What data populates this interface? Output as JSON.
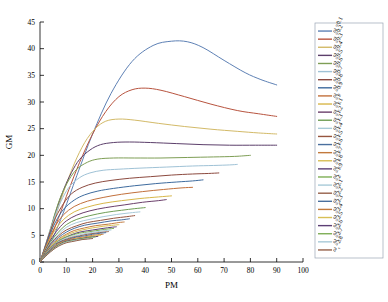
{
  "chart_data": {
    "type": "line",
    "title": "",
    "xlabel": "PM",
    "ylabel": "GM",
    "xlim": [
      0,
      100
    ],
    "ylim": [
      0,
      45
    ],
    "xticks": [
      0,
      10,
      20,
      30,
      40,
      50,
      60,
      70,
      80,
      90,
      100
    ],
    "yticks": [
      0,
      5,
      10,
      15,
      20,
      25,
      30,
      35,
      40,
      45
    ],
    "grid": false,
    "legend_position": "right-outside",
    "legend_symbol": "ω",
    "legend_subscript": "c",
    "series": [
      {
        "name": "ω_c = 0.1",
        "value": 0.1,
        "color": "#5e81b5",
        "x": [
          0,
          2,
          5,
          9,
          14,
          20,
          27,
          35,
          43,
          50,
          56,
          62,
          70,
          78,
          84,
          90
        ],
        "y": [
          0,
          1.6,
          4.6,
          9.4,
          16.2,
          24.0,
          31.6,
          37.6,
          40.6,
          41.4,
          41.3,
          40.2,
          37.8,
          35.5,
          34.2,
          33.2
        ]
      },
      {
        "name": "ω_c = 0.2",
        "value": 0.2,
        "color": "#b8543f",
        "x": [
          0,
          2,
          4,
          7,
          11,
          15,
          20,
          25,
          30,
          35,
          40,
          46,
          55,
          65,
          75,
          83,
          90
        ],
        "y": [
          0,
          2.0,
          4.4,
          8.2,
          13.6,
          18.6,
          24.0,
          28.2,
          31.0,
          32.3,
          32.6,
          32.2,
          31.0,
          29.6,
          28.4,
          27.8,
          27.3
        ]
      },
      {
        "name": "ω_c = 0.3",
        "value": 0.3,
        "color": "#d3ba68",
        "x": [
          0,
          2,
          4,
          6,
          9,
          13,
          17,
          21,
          25,
          30,
          36,
          45,
          55,
          65,
          75,
          83,
          90
        ],
        "y": [
          0,
          2.4,
          5.2,
          8.6,
          13.2,
          18.4,
          22.4,
          25.0,
          26.4,
          26.8,
          26.6,
          26.0,
          25.4,
          24.9,
          24.5,
          24.2,
          24.0
        ]
      },
      {
        "name": "ω_c = 0.4",
        "value": 0.4,
        "color": "#5c3f6b",
        "x": [
          0,
          2,
          4,
          6,
          9,
          12,
          15,
          19,
          23,
          28,
          34,
          42,
          52,
          62,
          72,
          82,
          90
        ],
        "y": [
          0,
          2.8,
          6.0,
          9.4,
          13.6,
          16.8,
          19.2,
          21.0,
          22.0,
          22.4,
          22.5,
          22.4,
          22.2,
          22.0,
          21.9,
          21.9,
          21.9
        ]
      },
      {
        "name": "ω_c = 0.5",
        "value": 0.5,
        "color": "#7e9e55",
        "x": [
          0,
          2,
          4,
          6,
          8,
          11,
          14,
          18,
          22,
          28,
          36,
          46,
          56,
          66,
          74,
          80
        ],
        "y": [
          0,
          3.0,
          6.3,
          9.6,
          12.4,
          15.4,
          17.4,
          18.7,
          19.3,
          19.5,
          19.5,
          19.5,
          19.6,
          19.7,
          19.8,
          20.0
        ]
      },
      {
        "name": "ω_c = 0.6",
        "value": 0.6,
        "color": "#9fc2d6",
        "x": [
          0,
          2,
          4,
          6,
          8,
          11,
          15,
          19,
          24,
          30,
          38,
          48,
          58,
          66,
          72,
          75
        ],
        "y": [
          0,
          3.1,
          6.2,
          9.0,
          11.4,
          14.0,
          15.8,
          16.7,
          17.2,
          17.4,
          17.6,
          17.8,
          18.0,
          18.1,
          18.2,
          18.3
        ]
      },
      {
        "name": "ω_c = 0.7",
        "value": 0.7,
        "color": "#8c4a3f",
        "x": [
          0,
          2,
          4,
          6,
          9,
          12,
          16,
          21,
          27,
          34,
          42,
          50,
          58,
          64,
          68
        ],
        "y": [
          0,
          3.0,
          5.9,
          8.4,
          11.0,
          12.8,
          14.0,
          14.8,
          15.3,
          15.7,
          16.0,
          16.3,
          16.5,
          16.6,
          16.7
        ]
      },
      {
        "name": "ω_c = 0.8",
        "value": 0.8,
        "color": "#3e6b9e",
        "x": [
          0,
          2,
          4,
          6,
          9,
          13,
          17,
          22,
          28,
          36,
          44,
          52,
          58,
          62
        ],
        "y": [
          0,
          2.8,
          5.4,
          7.6,
          9.9,
          11.6,
          12.6,
          13.3,
          13.8,
          14.3,
          14.7,
          15.0,
          15.2,
          15.4
        ]
      },
      {
        "name": "ω_c = 0.9",
        "value": 0.9,
        "color": "#c2703c",
        "x": [
          0,
          2,
          4,
          6,
          9,
          13,
          18,
          24,
          31,
          39,
          47,
          54,
          58
        ],
        "y": [
          0,
          2.6,
          4.9,
          6.9,
          8.9,
          10.4,
          11.4,
          12.1,
          12.7,
          13.2,
          13.6,
          13.9,
          14.0
        ]
      },
      {
        "name": "ω_c = 1",
        "value": 1.0,
        "color": "#d8b74a",
        "x": [
          0,
          2,
          4,
          6,
          9,
          13,
          18,
          24,
          31,
          38,
          45,
          50
        ],
        "y": [
          0,
          2.4,
          4.5,
          6.2,
          8.0,
          9.4,
          10.3,
          11.0,
          11.5,
          11.9,
          12.2,
          12.4
        ]
      },
      {
        "name": "ω_c = 1.1",
        "value": 1.1,
        "color": "#6b3f6b",
        "x": [
          0,
          2,
          4,
          7,
          10,
          14,
          19,
          25,
          32,
          39,
          45,
          48
        ],
        "y": [
          0,
          2.2,
          4.1,
          6.2,
          7.7,
          8.8,
          9.6,
          10.2,
          10.7,
          11.2,
          11.5,
          11.7
        ]
      },
      {
        "name": "ω_c = 1.2",
        "value": 1.2,
        "color": "#6f9e55",
        "x": [
          0,
          2,
          4,
          7,
          10,
          14,
          19,
          25,
          31,
          36,
          40
        ],
        "y": [
          0,
          2.0,
          3.8,
          5.6,
          7.0,
          8.0,
          8.7,
          9.3,
          9.7,
          10.0,
          10.2
        ]
      },
      {
        "name": "ω_c = 1.3",
        "value": 1.3,
        "color": "#a8cad8",
        "x": [
          0,
          2,
          4,
          7,
          10,
          14,
          19,
          24,
          29,
          34,
          38
        ],
        "y": [
          0,
          1.9,
          3.6,
          5.2,
          6.5,
          7.4,
          8.0,
          8.5,
          8.9,
          9.2,
          9.4
        ]
      },
      {
        "name": "ω_c = 1.4",
        "value": 1.4,
        "color": "#96553f",
        "x": [
          0,
          2,
          4,
          7,
          10,
          14,
          18,
          23,
          28,
          33,
          36
        ],
        "y": [
          0,
          1.8,
          3.4,
          4.9,
          6.0,
          6.8,
          7.4,
          7.8,
          8.2,
          8.5,
          8.7
        ]
      },
      {
        "name": "ω_c = 1.5",
        "value": 1.5,
        "color": "#4a6f9e",
        "x": [
          0,
          2,
          4,
          7,
          10,
          13,
          17,
          22,
          27,
          31,
          34
        ],
        "y": [
          0,
          1.7,
          3.2,
          4.6,
          5.6,
          6.3,
          6.9,
          7.3,
          7.7,
          7.9,
          8.1
        ]
      },
      {
        "name": "ω_c = 1.6",
        "value": 1.6,
        "color": "#c2793c",
        "x": [
          0,
          2,
          4,
          7,
          10,
          13,
          17,
          21,
          26,
          30,
          32
        ],
        "y": [
          0,
          1.6,
          3.0,
          4.3,
          5.2,
          5.9,
          6.4,
          6.8,
          7.1,
          7.4,
          7.5
        ]
      },
      {
        "name": "ω_c = 1.7",
        "value": 1.7,
        "color": "#d8bf55",
        "x": [
          0,
          2,
          4,
          7,
          10,
          13,
          16,
          20,
          24,
          28,
          30
        ],
        "y": [
          0,
          1.5,
          2.9,
          4.1,
          5.0,
          5.6,
          6.0,
          6.4,
          6.7,
          6.9,
          7.0
        ]
      },
      {
        "name": "ω_c = 1.8",
        "value": 1.8,
        "color": "#5c3f75",
        "x": [
          0,
          2,
          4,
          7,
          10,
          13,
          16,
          20,
          24,
          27,
          29
        ],
        "y": [
          0,
          1.45,
          2.7,
          3.9,
          4.7,
          5.3,
          5.7,
          6.0,
          6.3,
          6.5,
          6.6
        ]
      },
      {
        "name": "ω_c = 1.9",
        "value": 1.9,
        "color": "#7eae55",
        "x": [
          0,
          2,
          4,
          6,
          9,
          12,
          15,
          19,
          23,
          26,
          28
        ],
        "y": [
          0,
          1.4,
          2.6,
          3.6,
          4.5,
          5.0,
          5.4,
          5.7,
          6.0,
          6.2,
          6.3
        ]
      },
      {
        "name": "ω_c = 2",
        "value": 2.0,
        "color": "#a8cad8",
        "x": [
          0,
          2,
          4,
          6,
          9,
          12,
          15,
          18,
          22,
          25,
          27
        ],
        "y": [
          0,
          1.35,
          2.5,
          3.5,
          4.3,
          4.8,
          5.1,
          5.4,
          5.7,
          5.9,
          6.0
        ]
      },
      {
        "name": "ω_c = 2.1",
        "value": 2.1,
        "color": "#96614a",
        "x": [
          0,
          2,
          4,
          6,
          9,
          12,
          15,
          18,
          21,
          24,
          26
        ],
        "y": [
          0,
          1.3,
          2.4,
          3.4,
          4.1,
          4.6,
          4.9,
          5.2,
          5.4,
          5.6,
          5.7
        ]
      },
      {
        "name": "ω_c = 2.2",
        "value": 2.2,
        "color": "#4a6f9e",
        "x": [
          0,
          2,
          4,
          6,
          8,
          11,
          14,
          17,
          20,
          23,
          25
        ],
        "y": [
          0,
          1.25,
          2.3,
          3.2,
          3.8,
          4.3,
          4.7,
          4.9,
          5.2,
          5.4,
          5.5
        ]
      },
      {
        "name": "ω_c = 2.3",
        "value": 2.3,
        "color": "#c2793c",
        "x": [
          0,
          2,
          4,
          6,
          8,
          11,
          14,
          17,
          20,
          22,
          24
        ],
        "y": [
          0,
          1.2,
          2.2,
          3.1,
          3.7,
          4.2,
          4.5,
          4.7,
          5.0,
          5.1,
          5.2
        ]
      },
      {
        "name": "ω_c = 2.4",
        "value": 2.4,
        "color": "#d8bf55",
        "x": [
          0,
          2,
          4,
          6,
          8,
          11,
          13,
          16,
          19,
          21,
          23
        ],
        "y": [
          0,
          1.15,
          2.15,
          3.0,
          3.6,
          4.0,
          4.3,
          4.5,
          4.8,
          4.9,
          5.0
        ]
      },
      {
        "name": "ω_c = 2.5",
        "value": 2.5,
        "color": "#5c3f75",
        "x": [
          0,
          2,
          4,
          6,
          8,
          10,
          13,
          16,
          18,
          20,
          22
        ],
        "y": [
          0,
          1.1,
          2.1,
          2.9,
          3.5,
          3.9,
          4.2,
          4.4,
          4.6,
          4.7,
          4.8
        ]
      },
      {
        "name": "ω_c = 2.6",
        "value": 2.6,
        "color": "#7eae55",
        "x": [
          0,
          2,
          4,
          6,
          8,
          10,
          12,
          15,
          17,
          19,
          21
        ],
        "y": [
          0,
          1.08,
          2.0,
          2.8,
          3.4,
          3.8,
          4.0,
          4.3,
          4.4,
          4.6,
          4.7
        ]
      },
      {
        "name": "ω_c = 2.7",
        "value": 2.7,
        "color": "#a8cad8",
        "x": [
          0,
          2,
          4,
          6,
          8,
          10,
          12,
          14,
          17,
          19,
          20
        ],
        "y": [
          0,
          1.05,
          1.95,
          2.7,
          3.3,
          3.7,
          3.9,
          4.1,
          4.3,
          4.4,
          4.5
        ]
      },
      {
        "name": "ω_c = 2.8",
        "value": 2.8,
        "color": "#96614a",
        "x": [
          0,
          2,
          4,
          6,
          8,
          10,
          12,
          14,
          16,
          18,
          20
        ],
        "y": [
          0,
          1.0,
          1.9,
          2.65,
          3.2,
          3.6,
          3.8,
          4.0,
          4.2,
          4.3,
          4.4
        ]
      }
    ]
  }
}
